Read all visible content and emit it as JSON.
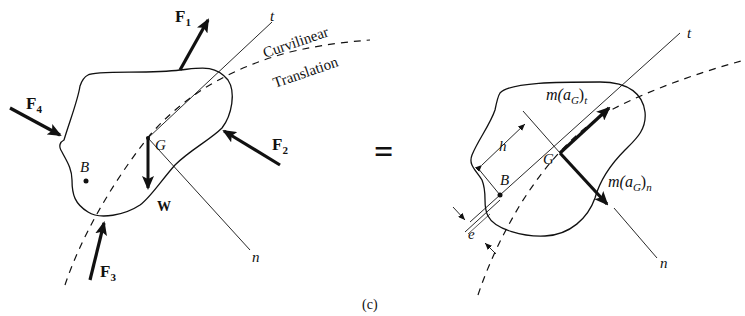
{
  "figure": {
    "caption": "(c)",
    "equals_sign": "="
  },
  "left_diagram": {
    "forces": {
      "f1": {
        "name": "F",
        "sub": "1"
      },
      "f2": {
        "name": "F",
        "sub": "2"
      },
      "f3": {
        "name": "F",
        "sub": "3"
      },
      "f4": {
        "name": "F",
        "sub": "4"
      },
      "weight": "W"
    },
    "points": {
      "g": "G",
      "b": "B"
    },
    "axes": {
      "t": "t",
      "n": "n"
    },
    "path_label_line1": "Curvilinear",
    "path_label_line2": "Translation"
  },
  "right_diagram": {
    "inertia_tangential": {
      "prefix": "m(a",
      "sub": "G",
      "suffix": ")",
      "axis": "t"
    },
    "inertia_normal": {
      "prefix": "m(a",
      "sub": "G",
      "suffix": ")",
      "axis": "n"
    },
    "points": {
      "g": "G",
      "b": "B"
    },
    "axes": {
      "t": "t",
      "n": "n"
    },
    "dimensions": {
      "h": "h",
      "e": "e"
    }
  }
}
